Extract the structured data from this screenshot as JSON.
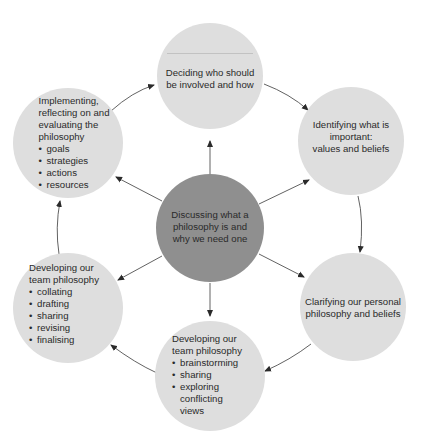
{
  "diagram": {
    "type": "cycle",
    "center": {
      "label": "Discussing what a philosophy is and why we need one",
      "lines": [
        "Discussing what a",
        "philosophy is and",
        "why we need one"
      ],
      "color": "#8f8f8f"
    },
    "node_color": "#dedede",
    "nodes": [
      {
        "id": "top",
        "lines": [
          "Deciding who should",
          "be involved and how"
        ],
        "bullets": []
      },
      {
        "id": "top-right",
        "lines": [
          "Identifying what is",
          "important:",
          "values and beliefs"
        ],
        "bullets": []
      },
      {
        "id": "bottom-right",
        "lines": [
          "Clarifying our personal",
          "philosophy and beliefs"
        ],
        "bullets": []
      },
      {
        "id": "bottom",
        "lines": [
          "Developing our",
          "team philosophy"
        ],
        "bullets": [
          "brainstorming",
          "sharing",
          "exploring conflicting views"
        ]
      },
      {
        "id": "bottom-left",
        "lines": [
          "Developing our",
          "team philosophy"
        ],
        "bullets": [
          "collating",
          "drafting",
          "sharing",
          "revising",
          "finalising"
        ]
      },
      {
        "id": "top-left",
        "lines": [
          "Implementing,",
          "reflecting on and",
          "evaluating the",
          "philosophy"
        ],
        "bullets": [
          "goals",
          "strategies",
          "actions",
          "resources"
        ]
      }
    ],
    "cycle_order": [
      "top",
      "top-right",
      "bottom-right",
      "bottom",
      "bottom-left",
      "top-left",
      "top"
    ],
    "center_arrows_to": [
      "top",
      "top-right",
      "bottom-right",
      "bottom",
      "bottom-left",
      "top-left"
    ]
  }
}
